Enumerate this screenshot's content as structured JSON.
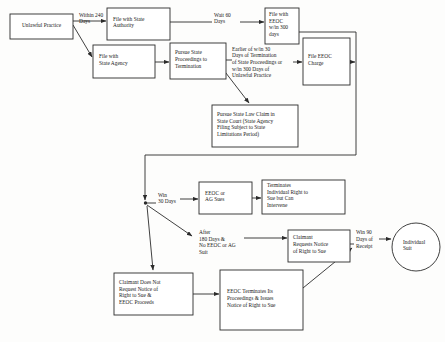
{
  "diagram": {
    "type": "flowchart",
    "colors": {
      "stroke": "#2b2b2b",
      "fill": "#ffffff",
      "background": "#fdfdfc"
    },
    "nodes": [
      {
        "id": "unlawful_practice",
        "label": "Unlawful Practice",
        "shape": "rect",
        "x": 10,
        "y": 14,
        "w": 63,
        "h": 25
      },
      {
        "id": "file_state_authority",
        "label": "File with State\nAuthority",
        "shape": "rect",
        "x": 107,
        "y": 8,
        "w": 63,
        "h": 32
      },
      {
        "id": "file_state_agency",
        "label": "File with\nState Agency",
        "shape": "rect",
        "x": 93,
        "y": 45,
        "w": 62,
        "h": 33
      },
      {
        "id": "pursue_state_proceedings",
        "label": "Pursue State\nProceedings to\nTermination",
        "shape": "rect",
        "x": 170,
        "y": 43,
        "w": 56,
        "h": 36
      },
      {
        "id": "file_eeoc_300",
        "label": "File with\nEEOC\nw/in 300\ndays",
        "shape": "rect",
        "x": 265,
        "y": 8,
        "w": 34,
        "h": 36
      },
      {
        "id": "file_eeoc_charge",
        "label": "File EEOC\nCharge",
        "shape": "rect",
        "x": 303,
        "y": 38,
        "w": 47,
        "h": 47
      },
      {
        "id": "pursue_state_law_claim",
        "label": "Pursue State Law Claim in\nState Court (State Agency\nFiling Subject to State\nLimitations Period)",
        "shape": "rect",
        "x": 212,
        "y": 105,
        "w": 86,
        "h": 42
      },
      {
        "id": "eeoc_or_ag_sues",
        "label": "EEOC   or\nAG Sues",
        "shape": "rect",
        "x": 199,
        "y": 182,
        "w": 53,
        "h": 32
      },
      {
        "id": "terminates_individual_right",
        "label": "Terminates\nIndividual Right to\nSue but Can\nIntervene",
        "shape": "rect",
        "x": 262,
        "y": 180,
        "w": 83,
        "h": 34
      },
      {
        "id": "claimant_requests_notice",
        "label": "Claimant\nRequests Notice\nof Right to Sue",
        "shape": "rect",
        "x": 288,
        "y": 230,
        "w": 62,
        "h": 32
      },
      {
        "id": "claimant_does_not_request",
        "label": "Claimant Does Not\nRequest Notice of\nRight to Sue &\nEEOC Proceeds",
        "shape": "rect",
        "x": 114,
        "y": 273,
        "w": 79,
        "h": 42
      },
      {
        "id": "eeoc_terminates",
        "label": "EEOC Terminates Its\nProceedings & Issues\nNotice of Right to Sue",
        "shape": "rect",
        "x": 220,
        "y": 270,
        "w": 83,
        "h": 60
      },
      {
        "id": "individual_suit",
        "label": "Individual\nSuit",
        "shape": "circle",
        "cx": 416,
        "cy": 247,
        "r": 24
      }
    ],
    "edge_labels": [
      {
        "id": "within_240_days",
        "text": "Within 240\nDays",
        "x": 79,
        "y": 14
      },
      {
        "id": "wait_60_days",
        "text": "Wait 60\nDays",
        "x": 214,
        "y": 14
      },
      {
        "id": "earlier_of_30_days",
        "text": "Earlier of w/in 30\nDays of Termination\nof State Proceedings or\nw/in 300 Days of\nUnlawful Practice",
        "x": 229,
        "y": 51
      },
      {
        "id": "win_30_days",
        "text": "Win\n30 Days",
        "x": 158,
        "y": 196
      },
      {
        "id": "after_180_days",
        "text": "After\n180 Days &\nNo EEOC or AG\nSuit",
        "x": 199,
        "y": 231
      },
      {
        "id": "win_90_days",
        "text": "Win 90\nDays of\nReceipt",
        "x": 356,
        "y": 233
      }
    ]
  }
}
